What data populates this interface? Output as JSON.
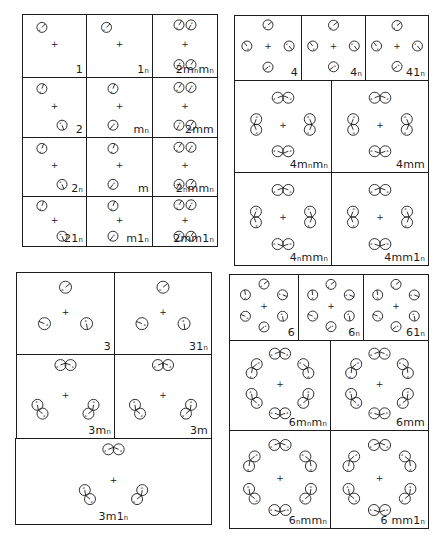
{
  "figure": {
    "groups": [
      {
        "id": "monoclinic-orthorhombic",
        "panels": [
          {
            "label": "1",
            "motifs": 1
          },
          {
            "label": "1ₙ",
            "motifs": 1
          },
          {
            "label": "2mₙmₙ",
            "motifs": 4
          },
          {
            "label": "2",
            "motifs": 2
          },
          {
            "label": "mₙ",
            "motifs": 2
          },
          {
            "label": "2mm",
            "motifs": 4
          },
          {
            "label": "2ₙ",
            "motifs": 2
          },
          {
            "label": "m",
            "motifs": 2
          },
          {
            "label": "2ₙmmₙ",
            "motifs": 4
          },
          {
            "label": "21ₙ",
            "motifs": 2
          },
          {
            "label": "m1ₙ",
            "motifs": 2
          },
          {
            "label": "2mm1ₙ",
            "motifs": 4
          }
        ]
      },
      {
        "id": "tetragonal",
        "panels": [
          {
            "label": "4",
            "motifs": 4
          },
          {
            "label": "4ₙ",
            "motifs": 4
          },
          {
            "label": "41ₙ",
            "motifs": 4
          },
          {
            "label": "4mₙmₙ",
            "motifs": 8
          },
          {
            "label": "4mm",
            "motifs": 8
          },
          {
            "label": "4ₙmmₙ",
            "motifs": 8
          },
          {
            "label": "4mm1ₙ",
            "motifs": 8
          }
        ]
      },
      {
        "id": "trigonal",
        "panels": [
          {
            "label": "3",
            "motifs": 3
          },
          {
            "label": "31ₙ",
            "motifs": 3
          },
          {
            "label": "3mₙ",
            "motifs": 6
          },
          {
            "label": "3m",
            "motifs": 6
          },
          {
            "label": "3m1ₙ",
            "motifs": 6
          }
        ]
      },
      {
        "id": "hexagonal",
        "panels": [
          {
            "label": "6",
            "motifs": 6
          },
          {
            "label": "6ₙ",
            "motifs": 6
          },
          {
            "label": "61ₙ",
            "motifs": 6
          },
          {
            "label": "6mₙmₙ",
            "motifs": 12
          },
          {
            "label": "6mm",
            "motifs": 12
          },
          {
            "label": "6ₙmmₙ",
            "motifs": 12
          },
          {
            "label": "6 mm1ₙ",
            "motifs": 12
          }
        ]
      }
    ],
    "center_symbol": "+",
    "line_color": "#1c1c1c"
  }
}
